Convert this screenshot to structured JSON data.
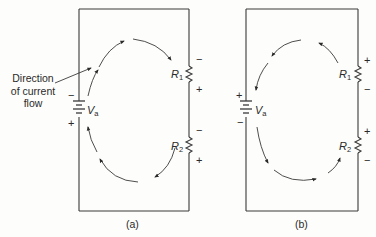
{
  "figure": {
    "panels": [
      {
        "id": "a",
        "caption": "(a)",
        "source_label": "V",
        "source_sub": "a",
        "source_top_sign": "−",
        "source_bottom_sign": "+",
        "resistors": [
          {
            "label": "R",
            "sub": "1",
            "top_sign": "−",
            "bottom_sign": "+"
          },
          {
            "label": "R",
            "sub": "2",
            "top_sign": "−",
            "bottom_sign": "+"
          }
        ],
        "current_direction": "clockwise"
      },
      {
        "id": "b",
        "caption": "(b)",
        "source_label": "V",
        "source_sub": "a",
        "source_top_sign": "+",
        "source_bottom_sign": "−",
        "resistors": [
          {
            "label": "R",
            "sub": "1",
            "top_sign": "+",
            "bottom_sign": "−"
          },
          {
            "label": "R",
            "sub": "2",
            "top_sign": "+",
            "bottom_sign": "−"
          }
        ],
        "current_direction": "counterclockwise"
      }
    ],
    "callout": {
      "line1": "Direction",
      "line2": "of current",
      "line3": "flow"
    },
    "colors": {
      "ink": "#2a2a2a",
      "background": "#fdfdfb"
    }
  }
}
